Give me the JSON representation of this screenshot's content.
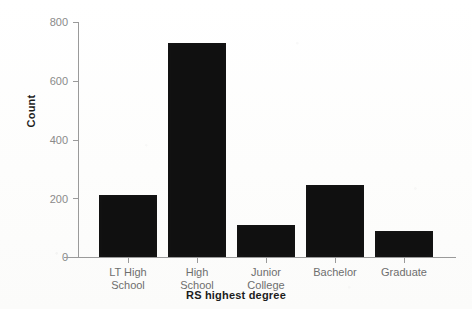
{
  "chart_data": {
    "type": "bar",
    "title": "",
    "xlabel": "RS highest degree",
    "ylabel": "Count",
    "categories": [
      "LT High School",
      "High School",
      "Junior College",
      "Bachelor",
      "Graduate"
    ],
    "category_lines": [
      [
        "LT High",
        "School"
      ],
      [
        "High",
        "School"
      ],
      [
        "Junior",
        "College"
      ],
      [
        "Bachelor",
        ""
      ],
      [
        "Graduate",
        ""
      ]
    ],
    "values": [
      210,
      730,
      110,
      245,
      90
    ],
    "ylim": [
      0,
      800
    ],
    "yticks": [
      0,
      200,
      400,
      600,
      800
    ],
    "ytick_labels": [
      "0",
      "200",
      "400",
      "600",
      "800"
    ],
    "grid": false,
    "legend": "none",
    "bar_color": "#101010",
    "axis_color": "#9a9a9a",
    "tick_label_color": "#8a8a8a",
    "axis_title_color": "#1c1c1c",
    "background_color": "#ffffff"
  }
}
